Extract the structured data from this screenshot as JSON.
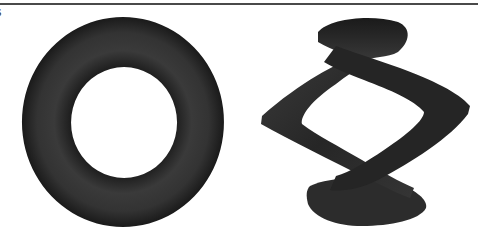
{
  "page": {
    "cut_text": "s"
  },
  "figures": [
    {
      "name": "torus",
      "description": "Shaded torus viewed from above (genus-one surface)"
    },
    {
      "name": "twisted-torus",
      "description": "Twisted/knotted torus-like surface with self-crossings"
    }
  ],
  "colors": {
    "surface": "#2a2a2a",
    "rule": "#4a4a4a",
    "background": "#ffffff"
  }
}
